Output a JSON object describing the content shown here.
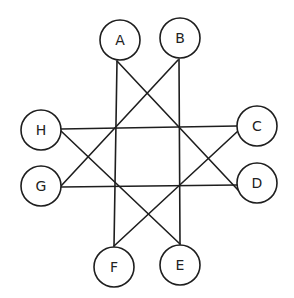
{
  "diagram": {
    "type": "graph",
    "colors": {
      "stroke": "#1e1e1e",
      "background": "#ffffff",
      "text": "#222222"
    },
    "nodes": [
      {
        "id": "A",
        "label": "A",
        "x": 120,
        "y": 40,
        "r": 20
      },
      {
        "id": "B",
        "label": "B",
        "x": 180,
        "y": 38,
        "r": 20
      },
      {
        "id": "C",
        "label": "C",
        "x": 257,
        "y": 126,
        "r": 20
      },
      {
        "id": "D",
        "label": "D",
        "x": 257,
        "y": 183,
        "r": 20
      },
      {
        "id": "E",
        "label": "E",
        "x": 180,
        "y": 265,
        "r": 20
      },
      {
        "id": "F",
        "label": "F",
        "x": 114,
        "y": 267,
        "r": 20
      },
      {
        "id": "G",
        "label": "G",
        "x": 41,
        "y": 186,
        "r": 20
      },
      {
        "id": "H",
        "label": "H",
        "x": 41,
        "y": 130,
        "r": 20
      }
    ],
    "edges": [
      {
        "from": "A",
        "to": "F",
        "x1": 117,
        "y1": 61,
        "x2": 114,
        "y2": 246
      },
      {
        "from": "A",
        "to": "D",
        "x1": 117,
        "y1": 61,
        "x2": 238,
        "y2": 190
      },
      {
        "from": "B",
        "to": "E",
        "x1": 179,
        "y1": 59,
        "x2": 180,
        "y2": 244
      },
      {
        "from": "B",
        "to": "G",
        "x1": 178,
        "y1": 60,
        "x2": 61,
        "y2": 186
      },
      {
        "from": "H",
        "to": "C",
        "x1": 61,
        "y1": 129,
        "x2": 237,
        "y2": 126
      },
      {
        "from": "H",
        "to": "E",
        "x1": 61,
        "y1": 131,
        "x2": 180,
        "y2": 244
      },
      {
        "from": "G",
        "to": "D",
        "x1": 61,
        "y1": 187,
        "x2": 237,
        "y2": 185
      },
      {
        "from": "C",
        "to": "F",
        "x1": 238,
        "y1": 131,
        "x2": 114,
        "y2": 246
      }
    ]
  }
}
